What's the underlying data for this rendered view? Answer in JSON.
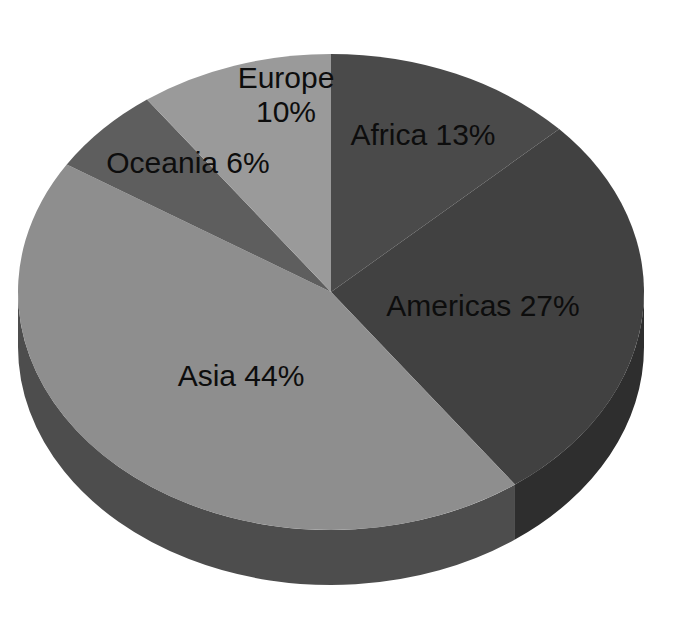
{
  "chart_data": {
    "type": "pie",
    "title": "",
    "subtitle": "",
    "xlabel": "",
    "ylabel": "",
    "grid": false,
    "legend_position": "none",
    "style": "3d-pie-grayscale",
    "labels_inside": true,
    "total_percent": 100,
    "categories": [
      "Africa",
      "Americas",
      "Asia",
      "Oceania",
      "Europe"
    ],
    "values": [
      13,
      27,
      44,
      6,
      10
    ],
    "unit": "%",
    "slices": [
      {
        "name": "Africa",
        "value": 13,
        "label": "Africa 13%",
        "color": "#4a4a4a",
        "side_color": "#343434",
        "start_angle": 0,
        "end_angle": 46.8,
        "label_x": 423,
        "label_y": 137
      },
      {
        "name": "Americas",
        "value": 27,
        "label": "Americas 27%",
        "color": "#414141",
        "side_color": "#2e2e2e",
        "start_angle": 46.8,
        "end_angle": 144.0,
        "label_x": 483,
        "label_y": 308
      },
      {
        "name": "Asia",
        "value": 44,
        "label": "Asia 44%",
        "color": "#8e8e8e",
        "side_color": "#4d4d4d",
        "start_angle": 144.0,
        "end_angle": 302.4,
        "label_x": 241,
        "label_y": 378
      },
      {
        "name": "Oceania",
        "value": 6,
        "label": "Oceania 6%",
        "color": "#5e5e5e",
        "side_color": "#454545",
        "start_angle": 302.4,
        "end_angle": 324.0,
        "label_x": 188,
        "label_y": 165
      },
      {
        "name": "Europe",
        "value": 10,
        "label": "Europe",
        "label_line2": "10%",
        "color": "#9a9a9a",
        "side_color": "#6a6a6a",
        "start_angle": 324.0,
        "end_angle": 360.0,
        "label_x": 286,
        "label_y": 80
      }
    ],
    "geometry": {
      "center_x": 331,
      "center_y": 292,
      "radius_x": 313,
      "radius_y": 238,
      "depth": 55
    },
    "background_color": "#ffffff",
    "label_text_color": "#0d0d0d"
  }
}
